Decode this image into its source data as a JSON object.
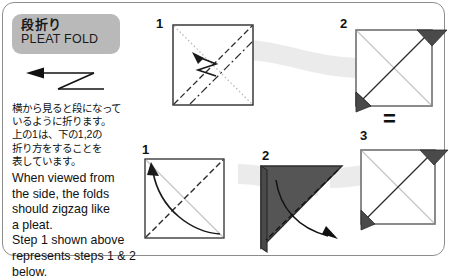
{
  "card": {
    "title_jp": "段折り",
    "title_en": "PLEAT FOLD",
    "symbol_name": "pleat-fold-zigzag-arrow",
    "description_jp": "横から見ると段になって\nいるように折ります。\n上の1は、下の1,2の\n折り方をすることを\n表しています。",
    "description_en": "When viewed from\nthe side, the folds\nshould zigzag like\na pleat.\nStep 1 shown above\nrepresents steps 1 & 2\nbelow."
  },
  "colors": {
    "badge_bg": "#b9b9b9",
    "frame_border": "#8d8d8d",
    "band": "#ebebeb",
    "paper_dark": "#4a4a4a",
    "paper_line": "#b5b5b5",
    "ink": "#111111"
  },
  "top_row": {
    "label": "top-row",
    "steps": [
      {
        "number": "1",
        "name": "pleat-fold-summary-square",
        "kind": "square-with-zigzag-arrow",
        "lines": [
          "dotted-diagonal-tl-br",
          "dashed-diagonal-bl-tr",
          "dash-dot-diagonal"
        ],
        "arrow": "zigzag-arrow-up-left"
      },
      {
        "number": "2",
        "name": "pleat-fold-result-square",
        "kind": "square-with-dark-corner-flaps",
        "flaps": [
          "top-right",
          "bottom-left"
        ]
      }
    ],
    "equals_sign": "="
  },
  "bottom_row": {
    "label": "bottom-row",
    "steps": [
      {
        "number": "1",
        "name": "valley-fold-square",
        "kind": "square-with-curved-arrow",
        "lines": [
          "light-diagonal-tl-br",
          "dashed-diagonal-bl-tr"
        ],
        "arrow": "curved-arrow-to-top-left"
      },
      {
        "number": "2",
        "name": "folded-triangle",
        "kind": "dark-triangle-with-fold-line",
        "lines": [
          "dashed-fold-line"
        ],
        "arrow": "curved-arrow-out-right"
      },
      {
        "number": "3",
        "name": "pleat-fold-final-square",
        "kind": "square-with-dark-corner-flaps",
        "flaps": [
          "top-right",
          "bottom-left"
        ]
      }
    ]
  }
}
